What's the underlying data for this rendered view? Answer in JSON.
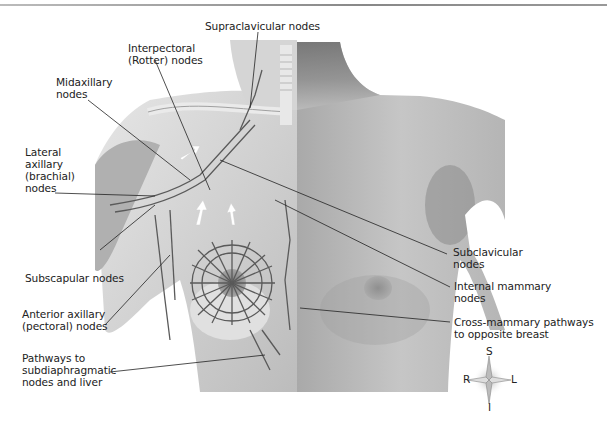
{
  "header": {
    "fragment": "y... ...e ...east"
  },
  "figure": {
    "labels": [
      {
        "id": "supraclavicular",
        "text": "Supraclavicular nodes"
      },
      {
        "id": "interpectoral",
        "lines": [
          "Interpectoral",
          "(Rotter) nodes"
        ]
      },
      {
        "id": "midaxillary",
        "lines": [
          "Midaxillary",
          "nodes"
        ]
      },
      {
        "id": "lateral-axillary",
        "lines": [
          "Lateral",
          "axillary",
          "(brachial)",
          "nodes"
        ]
      },
      {
        "id": "subscapular",
        "text": "Subscapular nodes"
      },
      {
        "id": "anterior-axillary",
        "lines": [
          "Anterior axillary",
          "(pectoral) nodes"
        ]
      },
      {
        "id": "pathways-subdiaphragmatic",
        "lines": [
          "Pathways to",
          "subdiaphragmatic",
          "nodes and liver"
        ]
      },
      {
        "id": "subclavicular",
        "lines": [
          "Subclavicular",
          "nodes"
        ]
      },
      {
        "id": "internal-mammary",
        "lines": [
          "Internal mammary",
          "nodes"
        ]
      },
      {
        "id": "cross-mammary",
        "lines": [
          "Cross-mammary pathways",
          "to opposite breast"
        ]
      }
    ],
    "compass": {
      "superior": "S",
      "inferior": "I",
      "right": "R",
      "left": "L"
    }
  },
  "colors": {
    "background": "#ffffff",
    "skin": "#c9c9c9",
    "skin_shadow": "#8d8d8d",
    "muscle": "#d8d8d8",
    "lymph_vessel": "#5a5a5a",
    "leader_line": "#222222",
    "text": "#222222"
  }
}
